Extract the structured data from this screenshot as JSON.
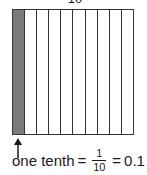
{
  "diagram": {
    "top_label": "10",
    "grid": {
      "columns": 10,
      "shaded_columns": [
        0
      ],
      "shade_color": "#7a7a7a",
      "line_color": "#333333"
    },
    "caption": {
      "words": "one tenth",
      "equals_1": "=",
      "fraction_numerator": "1",
      "fraction_denominator": "10",
      "equals_2": "=",
      "decimal": "0.1"
    }
  }
}
